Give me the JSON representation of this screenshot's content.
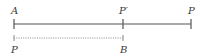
{
  "diagram": {
    "top_line": {
      "style": "solid",
      "color": "#555555",
      "points": [
        {
          "label": "A",
          "x": 14
        },
        {
          "label": "P′",
          "x": 123
        },
        {
          "label": "P",
          "x": 191
        }
      ]
    },
    "bottom_line": {
      "style": "dotted",
      "color": "#777777",
      "points": [
        {
          "label": "P",
          "x": 14
        },
        {
          "label": "B",
          "x": 123
        }
      ]
    },
    "labels": {
      "top_a": "A",
      "top_p_prime": "P′",
      "top_p": "P",
      "bottom_p": "P",
      "bottom_b": "B"
    }
  }
}
